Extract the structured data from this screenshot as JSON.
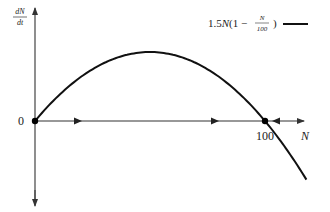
{
  "chart_data": {
    "type": "line",
    "title": "",
    "xlabel": "N",
    "ylabel": "dN/dt",
    "ylabel_numerator": "dN",
    "ylabel_denominator": "dt",
    "function": "1.5N(1 - N/100)",
    "legend": [
      {
        "label_prefix": "1.5N(1 − ",
        "label_numerator": "N",
        "label_denominator": "100",
        "label_suffix": ")",
        "color": "#111111"
      }
    ],
    "legend_position": "top-right",
    "grid": false,
    "x_ticks": [
      {
        "value": 0,
        "label": "0"
      },
      {
        "value": 100,
        "label": "100"
      }
    ],
    "equilibria": [
      {
        "N": 0,
        "type": "unstable"
      },
      {
        "N": 100,
        "type": "stable"
      }
    ],
    "phase_arrows": [
      {
        "interval": [
          0,
          100
        ],
        "direction": "right"
      },
      {
        "interval": [
          100,
          120
        ],
        "direction": "left"
      }
    ],
    "x": [
      0,
      10,
      20,
      30,
      40,
      50,
      60,
      70,
      80,
      90,
      100,
      110,
      120
    ],
    "series": [
      {
        "name": "1.5N(1 - N/100)",
        "values": [
          0,
          13.5,
          24,
          31.5,
          36,
          37.5,
          36,
          31.5,
          24,
          13.5,
          0,
          -16.5,
          -36
        ]
      }
    ],
    "xlim": [
      0,
      125
    ],
    "ylim": [
      -60,
      50
    ],
    "colors": {
      "curve": "#111111",
      "axis": "#333333",
      "text": "#222222"
    }
  }
}
